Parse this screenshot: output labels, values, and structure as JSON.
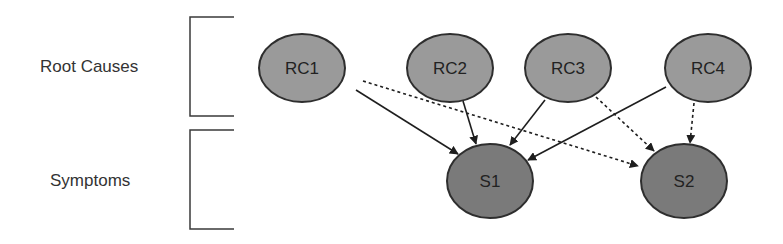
{
  "groups": [
    {
      "id": "root_causes",
      "label": "Root Causes",
      "label_x": 40,
      "label_y": 59,
      "bracket": {
        "x": 190,
        "y1": 17,
        "y2": 116,
        "x2": 234
      }
    },
    {
      "id": "symptoms",
      "label": "Symptoms",
      "label_x": 50,
      "label_y": 172,
      "bracket": {
        "x": 190,
        "y1": 130,
        "y2": 229,
        "x2": 234
      }
    }
  ],
  "nodes": [
    {
      "id": "RC1",
      "label": "RC1",
      "cx": 302,
      "cy": 68,
      "rx": 43,
      "ry": 34,
      "fill": "#9a9a9a",
      "group": "root_causes"
    },
    {
      "id": "RC2",
      "label": "RC2",
      "cx": 450,
      "cy": 68,
      "rx": 43,
      "ry": 34,
      "fill": "#9a9a9a",
      "group": "root_causes"
    },
    {
      "id": "RC3",
      "label": "RC3",
      "cx": 568,
      "cy": 68,
      "rx": 43,
      "ry": 34,
      "fill": "#9a9a9a",
      "group": "root_causes"
    },
    {
      "id": "RC4",
      "label": "RC4",
      "cx": 708,
      "cy": 68,
      "rx": 43,
      "ry": 34,
      "fill": "#9a9a9a",
      "group": "root_causes"
    },
    {
      "id": "S1",
      "label": "S1",
      "cx": 490,
      "cy": 181,
      "rx": 43,
      "ry": 37,
      "fill": "#7a7a7a",
      "group": "symptoms"
    },
    {
      "id": "S2",
      "label": "S2",
      "cx": 684,
      "cy": 181,
      "rx": 43,
      "ry": 37,
      "fill": "#7a7a7a",
      "group": "symptoms"
    }
  ],
  "edges": [
    {
      "from": "RC1",
      "to": "S1",
      "style": "solid",
      "x1": 356,
      "y1": 90,
      "x2": 458,
      "y2": 154
    },
    {
      "from": "RC1",
      "to": "S2",
      "style": "dotted",
      "x1": 363,
      "y1": 81,
      "x2": 638,
      "y2": 166
    },
    {
      "from": "RC2",
      "to": "S1",
      "style": "solid",
      "x1": 463,
      "y1": 101,
      "x2": 476,
      "y2": 144
    },
    {
      "from": "RC3",
      "to": "S1",
      "style": "solid",
      "x1": 545,
      "y1": 100,
      "x2": 510,
      "y2": 145
    },
    {
      "from": "RC3",
      "to": "S2",
      "style": "dotted",
      "x1": 596,
      "y1": 97,
      "x2": 654,
      "y2": 151
    },
    {
      "from": "RC4",
      "to": "S1",
      "style": "solid",
      "x1": 666,
      "y1": 87,
      "x2": 528,
      "y2": 160
    },
    {
      "from": "RC4",
      "to": "S2",
      "style": "dotted",
      "x1": 694,
      "y1": 103,
      "x2": 690,
      "y2": 143
    }
  ],
  "colors": {
    "stroke": "#2e2e2e",
    "edge": "#1e1e1e",
    "bracket": "#3a3a3a",
    "text": "#333333"
  }
}
